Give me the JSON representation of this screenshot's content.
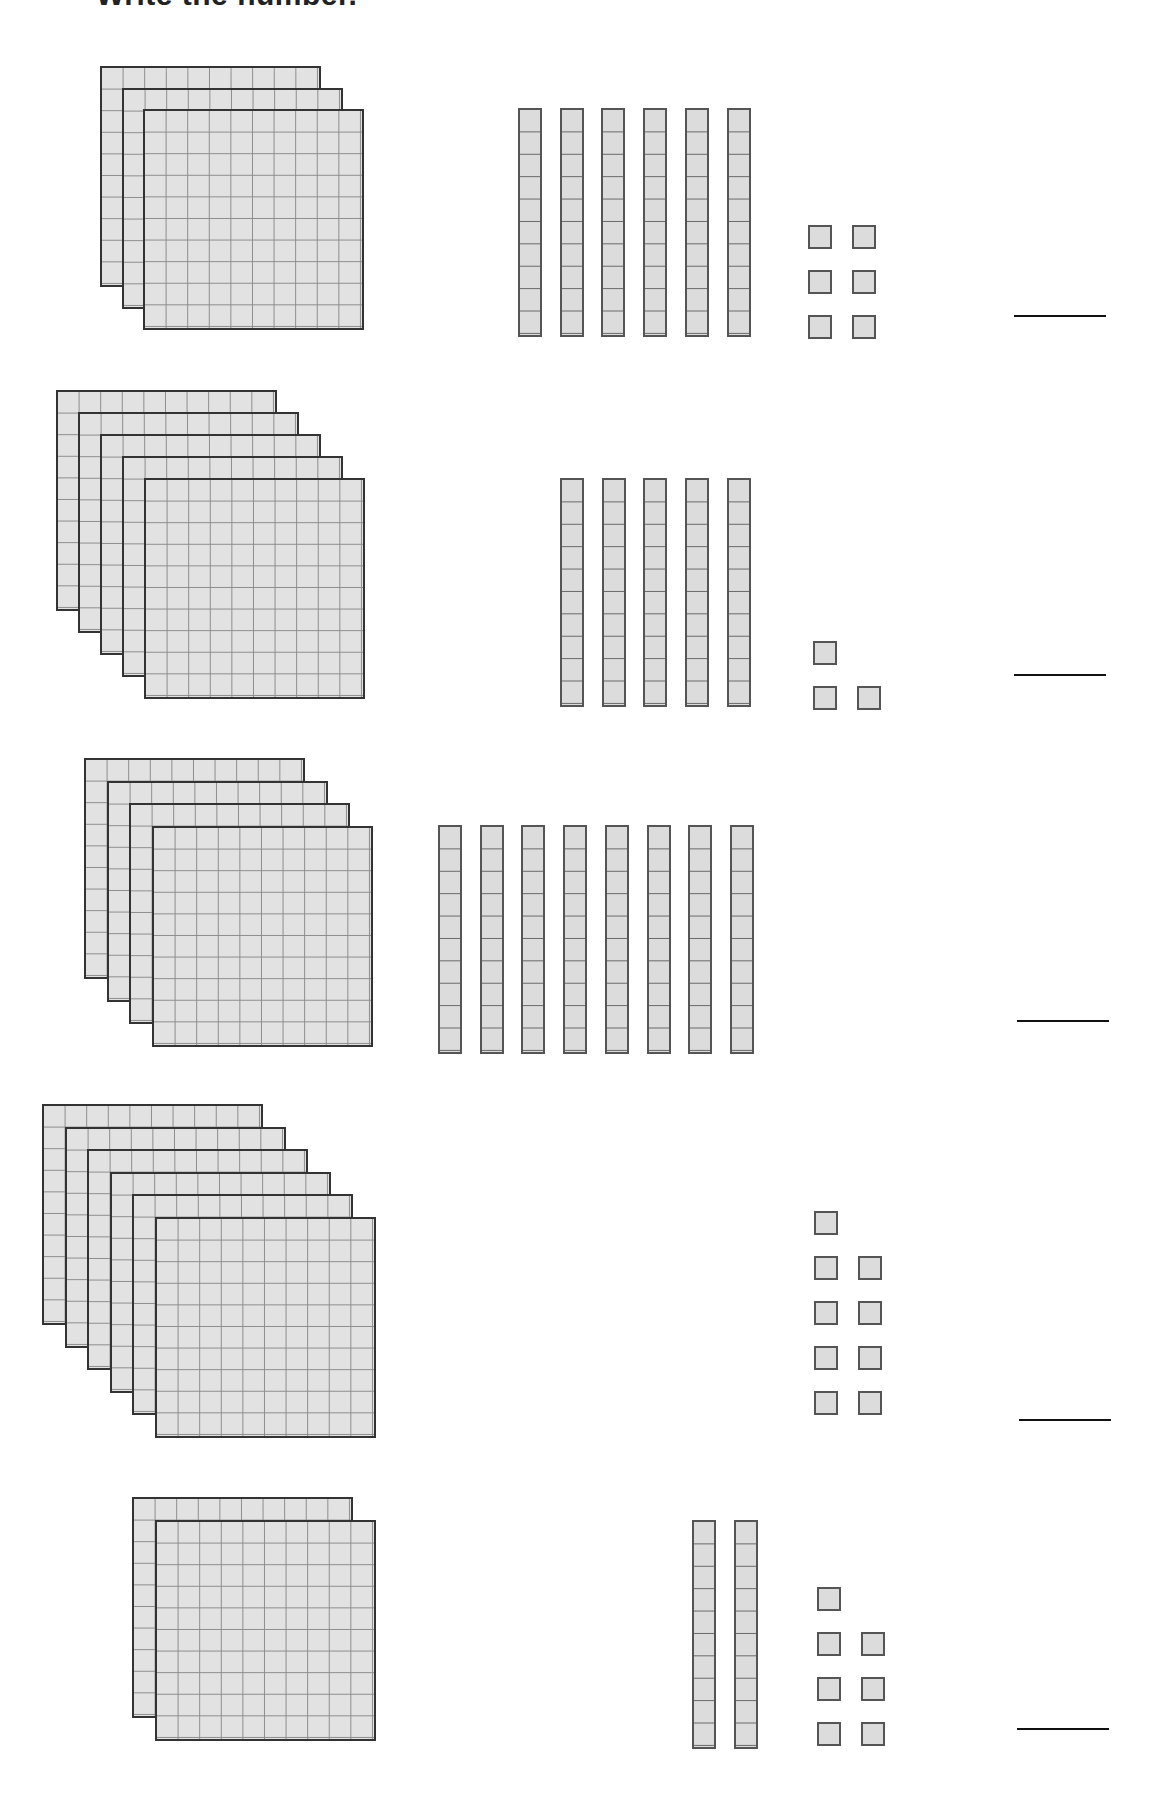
{
  "worksheet": {
    "title": "Write the number.",
    "colors": {
      "block_fill": "#e2e2e2",
      "grid_line": "#8c8c8c",
      "block_border": "#333333",
      "answer_line": "#111111"
    },
    "problems": [
      {
        "id": 1,
        "hundreds": 3,
        "tens": 6,
        "ones": 6,
        "answer": "366"
      },
      {
        "id": 2,
        "hundreds": 5,
        "tens": 5,
        "ones": 3,
        "answer": "553"
      },
      {
        "id": 3,
        "hundreds": 4,
        "tens": 8,
        "ones": 0,
        "answer": "480"
      },
      {
        "id": 4,
        "hundreds": 6,
        "tens": 0,
        "ones": 9,
        "answer": "609"
      },
      {
        "id": 5,
        "hundreds": 2,
        "tens": 2,
        "ones": 7,
        "answer": "227"
      }
    ]
  },
  "layout": {
    "problems": [
      {
        "top": 66,
        "flat_left": 100,
        "flat_step": 21.5,
        "rods_left": 518,
        "rods_top": 108,
        "units": [
          [
            808,
            225
          ],
          [
            852,
            225
          ],
          [
            808,
            270
          ],
          [
            852,
            270
          ],
          [
            808,
            315
          ],
          [
            852,
            315
          ]
        ],
        "line": [
          1014,
          315
        ]
      },
      {
        "top": 390,
        "flat_left": 56,
        "flat_step": 22,
        "rods_left": 560,
        "rods_top": 478,
        "units": [
          [
            813,
            641
          ],
          [
            813,
            686
          ],
          [
            857,
            686
          ]
        ],
        "line": [
          1014,
          674
        ]
      },
      {
        "top": 758,
        "flat_left": 84,
        "flat_step": 22.5,
        "rods_left": 438,
        "rods_top": 825,
        "units": [],
        "line": [
          1017,
          1020
        ]
      },
      {
        "top": 1104,
        "flat_left": 42,
        "flat_step": 22.5,
        "rods_left": 0,
        "rods_top": 0,
        "units": [
          [
            814,
            1211
          ],
          [
            814,
            1256
          ],
          [
            858,
            1256
          ],
          [
            814,
            1301
          ],
          [
            858,
            1301
          ],
          [
            814,
            1346
          ],
          [
            858,
            1346
          ],
          [
            814,
            1391
          ],
          [
            858,
            1391
          ]
        ],
        "line": [
          1019,
          1419
        ]
      },
      {
        "top": 1497,
        "flat_left": 132,
        "flat_step": 23,
        "rods_left": 692,
        "rods_top": 1520,
        "units": [
          [
            817,
            1587
          ],
          [
            817,
            1632
          ],
          [
            861,
            1632
          ],
          [
            817,
            1677
          ],
          [
            861,
            1677
          ],
          [
            817,
            1722
          ],
          [
            861,
            1722
          ]
        ],
        "line": [
          1017,
          1728
        ]
      }
    ],
    "rod_pitch": 41.7
  }
}
